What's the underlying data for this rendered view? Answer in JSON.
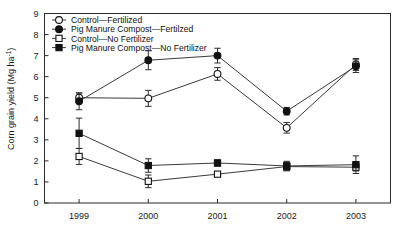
{
  "chart_data": {
    "type": "line",
    "title": "",
    "xlabel": "",
    "ylabel": "Corn grain yield (Mg ha",
    "ylabel_sup": "-1",
    "ylabel_tail": ")",
    "ylabel_full": "Corn grain yield (Mg ha-1)",
    "categories": [
      "1999",
      "2000",
      "2001",
      "2002",
      "2003"
    ],
    "x": [
      1999,
      2000,
      2001,
      2002,
      2003
    ],
    "ylim": [
      0,
      9
    ],
    "xlim": [
      1998.5,
      2003.5
    ],
    "yticks": [
      "0",
      "1",
      "2",
      "3",
      "4",
      "5",
      "6",
      "7",
      "8",
      "9"
    ],
    "grid": false,
    "legend_position": "top-left-inside",
    "error_bars": "standard error",
    "series": [
      {
        "name": "Control—Fertilized",
        "marker": "open-circle",
        "values": [
          5.0,
          4.97,
          6.13,
          3.57,
          6.58
        ],
        "err": [
          0.22,
          0.38,
          0.3,
          0.25,
          0.28
        ]
      },
      {
        "name": "Pig Manure Compost—Fertilzed",
        "marker": "filled-circle",
        "values": [
          4.83,
          6.78,
          7.0,
          4.36,
          6.5
        ],
        "err": [
          0.4,
          0.45,
          0.35,
          0.18,
          0.3
        ]
      },
      {
        "name": "Control—No Fertilizer",
        "marker": "open-square",
        "values": [
          2.21,
          1.03,
          1.37,
          1.73,
          1.7
        ],
        "err": [
          0.38,
          0.3,
          0.08,
          0.2,
          0.18
        ]
      },
      {
        "name": "Pig Manure Compost—No Fertilizer",
        "marker": "filled-square",
        "values": [
          3.31,
          1.78,
          1.9,
          1.76,
          1.82
        ],
        "err": [
          0.72,
          0.32,
          0.15,
          0.22,
          0.42
        ]
      }
    ]
  },
  "legend": {
    "items": [
      {
        "label": "Control—Fertilized",
        "marker": "open-circle"
      },
      {
        "label": "Pig Manure Compost—Fertilzed",
        "marker": "filled-circle"
      },
      {
        "label": "Control—No Fertilizer",
        "marker": "open-square"
      },
      {
        "label": "Pig Manure Compost—No Fertilizer",
        "marker": "filled-square"
      }
    ]
  },
  "colors": {
    "axis": "#2b2b2b",
    "line": "#3a3a3a",
    "marker_fill": "#111111",
    "marker_open": "#ffffff",
    "background": "#ffffff"
  }
}
